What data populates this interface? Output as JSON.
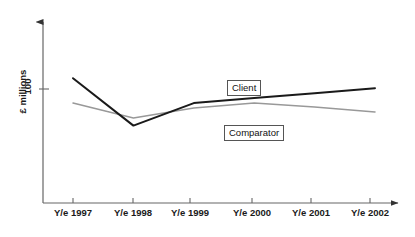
{
  "chart_data": {
    "type": "line",
    "title": "",
    "xlabel": "",
    "ylabel": "£ millions",
    "grid": false,
    "legend_position": "inline-callout-boxes",
    "categories": [
      "Y/e 1997",
      "Y/e 1998",
      "Y/e 1999",
      "Y/e 2000",
      "Y/e 2001",
      "Y/e 2002"
    ],
    "ytick_labels": [
      "100"
    ],
    "ytick_values": [
      100
    ],
    "ylim": [
      0,
      145
    ],
    "series": [
      {
        "name": "Client",
        "color": "#1a1a1a",
        "values": [
          100,
          62,
          80,
          84,
          88,
          92
        ]
      },
      {
        "name": "Comparator",
        "color": "#999999",
        "values": [
          80,
          68,
          76,
          80,
          77,
          73
        ]
      }
    ],
    "annotations": [
      {
        "text": "Client",
        "series": "Client"
      },
      {
        "text": "Comparator",
        "series": "Comparator"
      }
    ]
  },
  "axes": {
    "y_axis_title": "£ millions",
    "y_tick_100": "100",
    "x_labels": [
      {
        "label": "Y/e 1997"
      },
      {
        "label": "Y/e 1998"
      },
      {
        "label": "Y/e 1999"
      },
      {
        "label": "Y/e 2000"
      },
      {
        "label": "Y/e 2001"
      },
      {
        "label": "Y/e 2002"
      }
    ]
  },
  "legend": {
    "client_label": "Client",
    "comparator_label": "Comparator"
  },
  "colors": {
    "client_line": "#1a1a1a",
    "comparator_line": "#999999",
    "axis": "#555555",
    "text": "#1a1a1a",
    "background": "#ffffff"
  }
}
